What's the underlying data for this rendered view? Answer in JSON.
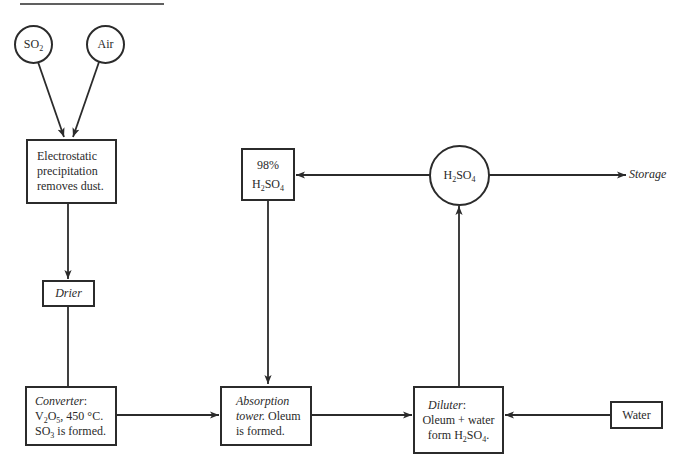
{
  "diagram": {
    "title_rule": true,
    "nodes": {
      "so2": {
        "label_main": "SO",
        "label_sub": "2"
      },
      "air": {
        "label": "Air"
      },
      "electrostatic": {
        "lines": [
          "Electrostatic",
          "precipitation",
          "removes dust."
        ]
      },
      "drier": {
        "label": "Drier"
      },
      "converter": {
        "title": "Converter",
        "title_suffix": ":",
        "line2_a": "V",
        "line2_sub1": "2",
        "line2_b": "O",
        "line2_sub2": "5",
        "line2_c": ", 450 °C.",
        "line3_a": "SO",
        "line3_sub": "3",
        "line3_b": " is formed."
      },
      "absorption": {
        "title_line1": "Absorption",
        "title_line2": "tower.",
        "line2_rest": " Oleum",
        "line3": "is formed."
      },
      "diluter": {
        "title": "Diluter",
        "title_suffix": ":",
        "line2": "Oleum + water",
        "line3_a": "form H",
        "line3_sub1": "2",
        "line3_b": "SO",
        "line3_sub2": "4",
        "line3_c": "."
      },
      "water": {
        "label": "Water"
      },
      "h2so4_98": {
        "line1": "98%",
        "line2_a": "H",
        "line2_sub1": "2",
        "line2_b": "SO",
        "line2_sub2": "4"
      },
      "h2so4_hub": {
        "a": "H",
        "sub1": "2",
        "b": "SO",
        "sub2": "4"
      },
      "storage": {
        "label": "Storage"
      }
    },
    "edges": [
      {
        "from": "SO2",
        "to": "Electrostatic precipitation"
      },
      {
        "from": "Air",
        "to": "Electrostatic precipitation"
      },
      {
        "from": "Electrostatic precipitation",
        "to": "Drier"
      },
      {
        "from": "Drier",
        "to": "Converter"
      },
      {
        "from": "Converter",
        "to": "Absorption tower"
      },
      {
        "from": "98% H2SO4",
        "to": "Absorption tower"
      },
      {
        "from": "Absorption tower",
        "to": "Diluter"
      },
      {
        "from": "Water",
        "to": "Diluter"
      },
      {
        "from": "Diluter",
        "to": "H2SO4"
      },
      {
        "from": "H2SO4",
        "to": "98% H2SO4"
      },
      {
        "from": "H2SO4",
        "to": "Storage"
      }
    ],
    "colors": {
      "ink": "#2b2b2b",
      "background": "#ffffff"
    }
  }
}
